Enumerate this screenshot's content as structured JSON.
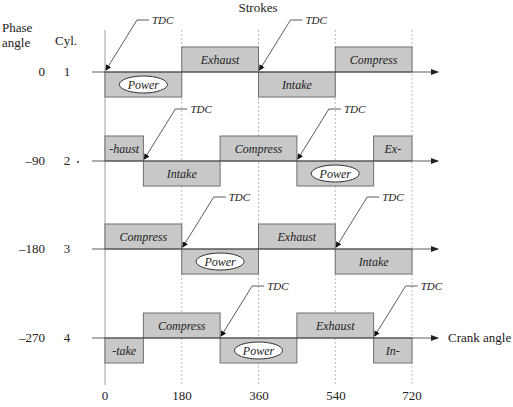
{
  "title": "Strokes",
  "header": {
    "phase_label_line1": "Phase",
    "phase_label_line2": "angle",
    "cyl_label": "Cyl."
  },
  "x_axis": {
    "label": "Crank angle",
    "ticks": [
      "0",
      "180",
      "360",
      "540",
      "720"
    ]
  },
  "tdc_label": "TDC",
  "colors": {
    "box_fill": "#c8c8c8",
    "box_stroke": "#6e6e6e",
    "axis": "#333333",
    "gridline": "#aaaaaa"
  },
  "cylinders": [
    {
      "phase": "0",
      "cyl": "1",
      "strokes": [
        {
          "label": "Power",
          "start": 0,
          "end": 180,
          "pos": "below",
          "oval": true
        },
        {
          "label": "Exhaust",
          "start": 180,
          "end": 360,
          "pos": "above",
          "oval": false
        },
        {
          "label": "Intake",
          "start": 360,
          "end": 540,
          "pos": "below",
          "oval": false
        },
        {
          "label": "Compress",
          "start": 540,
          "end": 720,
          "pos": "above",
          "oval": false
        }
      ],
      "tdc": [
        {
          "at": 0,
          "label": "TDC"
        },
        {
          "at": 360,
          "label": "TDC"
        }
      ]
    },
    {
      "phase": "–90",
      "cyl": "2",
      "strokes": [
        {
          "label": "-haust",
          "start": 0,
          "end": 90,
          "pos": "above",
          "oval": false
        },
        {
          "label": "Intake",
          "start": 90,
          "end": 270,
          "pos": "below",
          "oval": false
        },
        {
          "label": "Compress",
          "start": 270,
          "end": 450,
          "pos": "above",
          "oval": false
        },
        {
          "label": "Power",
          "start": 450,
          "end": 630,
          "pos": "below",
          "oval": true
        },
        {
          "label": "Ex-",
          "start": 630,
          "end": 720,
          "pos": "above",
          "oval": false
        }
      ],
      "tdc": [
        {
          "at": 90,
          "label": "TDC"
        },
        {
          "at": 450,
          "label": "TDC"
        }
      ]
    },
    {
      "phase": "–180",
      "cyl": "3",
      "strokes": [
        {
          "label": "Compress",
          "start": 0,
          "end": 180,
          "pos": "above",
          "oval": false
        },
        {
          "label": "Power",
          "start": 180,
          "end": 360,
          "pos": "below",
          "oval": true
        },
        {
          "label": "Exhaust",
          "start": 360,
          "end": 540,
          "pos": "above",
          "oval": false
        },
        {
          "label": "Intake",
          "start": 540,
          "end": 720,
          "pos": "below",
          "oval": false
        }
      ],
      "tdc": [
        {
          "at": 180,
          "label": "TDC"
        },
        {
          "at": 540,
          "label": "TDC"
        }
      ]
    },
    {
      "phase": "–270",
      "cyl": "4",
      "strokes": [
        {
          "label": "-take",
          "start": 0,
          "end": 90,
          "pos": "below",
          "oval": false
        },
        {
          "label": "Compress",
          "start": 90,
          "end": 270,
          "pos": "above",
          "oval": false
        },
        {
          "label": "Power",
          "start": 270,
          "end": 450,
          "pos": "below",
          "oval": true
        },
        {
          "label": "Exhaust",
          "start": 450,
          "end": 630,
          "pos": "above",
          "oval": false
        },
        {
          "label": "In-",
          "start": 630,
          "end": 720,
          "pos": "below",
          "oval": false
        }
      ],
      "tdc": [
        {
          "at": 270,
          "label": "TDC"
        },
        {
          "at": 630,
          "label": "TDC"
        }
      ]
    }
  ]
}
